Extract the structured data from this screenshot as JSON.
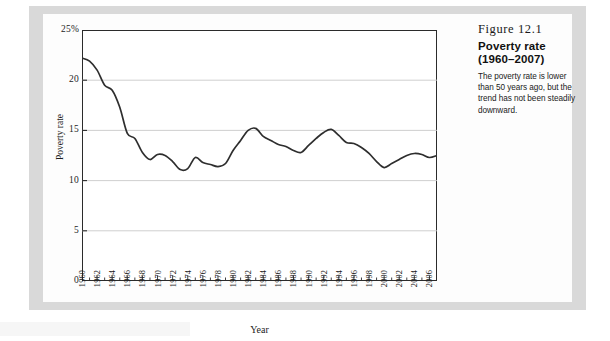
{
  "caption": {
    "figure_number": "Figure 12.1",
    "title_line1": "Poverty rate",
    "title_line2": "(1960–2007)",
    "body": "The poverty rate is lower than 50 years ago, but the trend has not been steadily downward."
  },
  "chart_data": {
    "type": "line",
    "title": "Poverty rate (1960–2007)",
    "xlabel": "Year",
    "ylabel": "Poverty rate",
    "xlim": [
      1960,
      2007
    ],
    "ylim": [
      0,
      25
    ],
    "ytick_labels": [
      "0",
      "5",
      "10",
      "15",
      "20",
      "25%"
    ],
    "ytick_values": [
      0,
      5,
      10,
      15,
      20,
      25
    ],
    "xtick_labels": [
      "1960",
      "1962",
      "1964",
      "1966",
      "1968",
      "1970",
      "1972",
      "1974",
      "1976",
      "1978",
      "1980",
      "1982",
      "1984",
      "1986",
      "1988",
      "1990",
      "1992",
      "1994",
      "1996",
      "1998",
      "2000",
      "2002",
      "2004",
      "2006"
    ],
    "xtick_values": [
      1960,
      1962,
      1964,
      1966,
      1968,
      1970,
      1972,
      1974,
      1976,
      1978,
      1980,
      1982,
      1984,
      1986,
      1988,
      1990,
      1992,
      1994,
      1996,
      1998,
      2000,
      2002,
      2004,
      2006
    ],
    "minor_tick_step": 1,
    "grid": "horizontal",
    "legend": "none",
    "line_color": "#2e2e2e",
    "grid_color": "#c9c9c9",
    "x": [
      1960,
      1961,
      1962,
      1963,
      1964,
      1965,
      1966,
      1967,
      1968,
      1969,
      1970,
      1971,
      1972,
      1973,
      1974,
      1975,
      1976,
      1977,
      1978,
      1979,
      1980,
      1981,
      1982,
      1983,
      1984,
      1985,
      1986,
      1987,
      1988,
      1989,
      1990,
      1991,
      1992,
      1993,
      1994,
      1995,
      1996,
      1997,
      1998,
      1999,
      2000,
      2001,
      2002,
      2003,
      2004,
      2005,
      2006,
      2007
    ],
    "values": [
      22.2,
      21.9,
      21.0,
      19.5,
      19.0,
      17.3,
      14.7,
      14.2,
      12.8,
      12.1,
      12.6,
      12.5,
      11.9,
      11.1,
      11.2,
      12.3,
      11.8,
      11.6,
      11.4,
      11.7,
      13.0,
      14.0,
      15.0,
      15.2,
      14.4,
      14.0,
      13.6,
      13.4,
      13.0,
      12.8,
      13.5,
      14.2,
      14.8,
      15.1,
      14.5,
      13.8,
      13.7,
      13.3,
      12.7,
      11.9,
      11.3,
      11.7,
      12.1,
      12.5,
      12.7,
      12.6,
      12.3,
      12.5
    ]
  }
}
